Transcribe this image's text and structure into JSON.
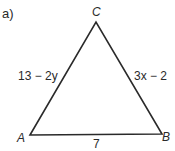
{
  "problem_label": "a)",
  "triangle": {
    "vertices": {
      "A": {
        "label": "A",
        "x": 30,
        "y": 135
      },
      "B": {
        "label": "B",
        "x": 162,
        "y": 134
      },
      "C": {
        "label": "C",
        "x": 96,
        "y": 22
      }
    },
    "sides": {
      "AC": "13 − 2y",
      "CB": "3x − 2",
      "AB": "7"
    },
    "stroke_color": "#2a2a2a"
  }
}
